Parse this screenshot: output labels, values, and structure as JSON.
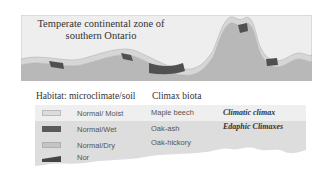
{
  "figure": {
    "title_line1": "Temperate continental zone of",
    "title_line2": "southern Ontario",
    "colors": {
      "sky": "#eeeeee",
      "ground": "#b8b8b8",
      "moist_band": "#d6d6d6",
      "wet_band": "#505050",
      "frame": "#c8c8c8"
    }
  },
  "legend": {
    "header_habitat": "Habitat: microclimate/soil",
    "header_biota": "Climax biota",
    "rows": [
      {
        "swatch": "light-gray",
        "swatch_color": "#dcdcdc",
        "habitat": "Normal/ Moist",
        "biota": "Maple beech",
        "note": "Climatic climax"
      },
      {
        "swatch": "dark-gray",
        "swatch_color": "#5a5a5a",
        "habitat": "Normal/Wet",
        "biota": "Oak-ash",
        "note": "Edaphic Climaxes"
      },
      {
        "swatch": "medium-gray",
        "swatch_color": "#c4c4c4",
        "habitat": "Normal/Dry",
        "biota": "Oak-hickory",
        "note": ""
      },
      {
        "swatch": "dark-wedge",
        "swatch_color": "#444444",
        "habitat": "Nor",
        "biota": "",
        "note": ""
      }
    ],
    "row_colors": {
      "first": "#efefef",
      "rest": "#dddddd"
    }
  }
}
